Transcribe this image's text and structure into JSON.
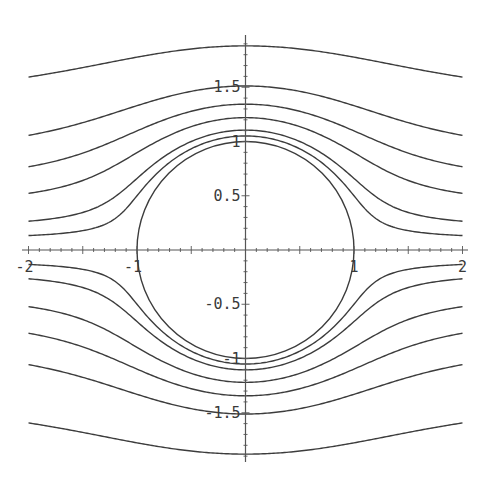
{
  "chart_data": {
    "type": "line",
    "title": "",
    "xlabel": "",
    "ylabel": "",
    "xlim": [
      -2,
      2
    ],
    "ylim": [
      -2,
      2
    ],
    "grid": false,
    "legend": null,
    "x_ticks": [
      -2,
      -1,
      1,
      2
    ],
    "x_tick_labels": [
      "-2",
      "-1",
      "1",
      "2"
    ],
    "y_ticks": [
      -1.5,
      -1,
      -0.5,
      0.5,
      1,
      1.5
    ],
    "y_tick_labels": [
      "-1.5",
      "-1",
      "-0.5",
      "0.5",
      "1",
      "1.5"
    ],
    "circle": {
      "cx": 0,
      "cy": 0,
      "r": 1
    },
    "stream_values": [
      0.1,
      0.2,
      0.4,
      0.6,
      0.85,
      1.35
    ],
    "series": [
      {
        "name": "psi=+0.1",
        "y_at_x_minus2": 0.13,
        "y_at_x0": 1.05
      },
      {
        "name": "psi=+0.2",
        "y_at_x_minus2": 0.26,
        "y_at_x0": 1.11
      },
      {
        "name": "psi=+0.4",
        "y_at_x_minus2": 0.53,
        "y_at_x0": 1.23
      },
      {
        "name": "psi=+0.6",
        "y_at_x_minus2": 0.78,
        "y_at_x0": 1.35
      },
      {
        "name": "psi=+0.85",
        "y_at_x_minus2": 1.02,
        "y_at_x0": 1.51
      },
      {
        "name": "psi=+1.35",
        "y_at_x_minus2": 1.57,
        "y_at_x0": 1.88
      },
      {
        "name": "psi=-0.1",
        "y_at_x_minus2": -0.13,
        "y_at_x0": -1.05
      },
      {
        "name": "psi=-0.2",
        "y_at_x_minus2": -0.26,
        "y_at_x0": -1.11
      },
      {
        "name": "psi=-0.4",
        "y_at_x_minus2": -0.53,
        "y_at_x0": -1.23
      },
      {
        "name": "psi=-0.6",
        "y_at_x_minus2": -0.78,
        "y_at_x0": -1.35
      },
      {
        "name": "psi=-0.85",
        "y_at_x_minus2": -1.02,
        "y_at_x0": -1.51
      },
      {
        "name": "psi=-1.35",
        "y_at_x_minus2": -1.57,
        "y_at_x0": -1.88
      }
    ],
    "line_color": "#3c3c3c",
    "axis_color": "#555555"
  }
}
